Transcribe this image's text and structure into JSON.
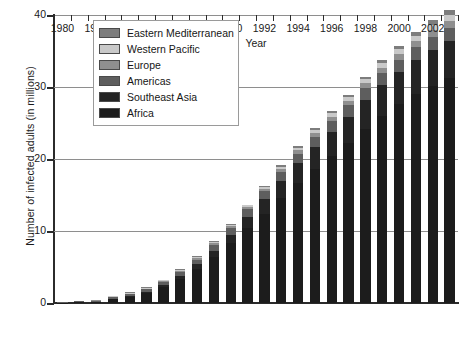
{
  "chart_data": {
    "type": "bar",
    "subtype": "stacked-bar",
    "title": "",
    "xlabel": "Year",
    "ylabel": "Number of infected adults (in millions)",
    "ylim": [
      0,
      40
    ],
    "yticks": [
      0,
      10,
      20,
      30,
      40
    ],
    "ytick_labels": [
      "0",
      "10",
      "20",
      "30",
      "40"
    ],
    "grid": true,
    "grid_axis": "y",
    "legend_position": "upper-left-inside",
    "categories": [
      "1980",
      "1981",
      "1982",
      "1983",
      "1984",
      "1985",
      "1986",
      "1987",
      "1988",
      "1989",
      "1990",
      "1991",
      "1992",
      "1993",
      "1994",
      "1995",
      "1996",
      "1997",
      "1998",
      "1999",
      "2000",
      "2001",
      "2002",
      "2003"
    ],
    "xtick_labels_shown": [
      "1980",
      "1982",
      "1984",
      "1986",
      "1988",
      "1990",
      "1992",
      "1994",
      "1996",
      "1998",
      "2000",
      "2002"
    ],
    "series": [
      {
        "name": "Africa",
        "color": "#1c1c1c",
        "values": [
          0.05,
          0.2,
          0.25,
          0.7,
          1.0,
          1.5,
          2.3,
          3.4,
          4.8,
          6.4,
          8.3,
          10.4,
          12.4,
          14.6,
          16.6,
          18.6,
          20.4,
          22.2,
          24.2,
          26.0,
          27.6,
          29.0,
          30.2,
          31.2
        ]
      },
      {
        "name": "Southeast Asia",
        "color": "#242424",
        "values": [
          0.0,
          0.0,
          0.0,
          0.05,
          0.1,
          0.15,
          0.25,
          0.4,
          0.6,
          0.9,
          1.2,
          1.6,
          2.0,
          2.4,
          2.8,
          3.1,
          3.4,
          3.7,
          4.0,
          4.3,
          4.5,
          4.8,
          5.0,
          5.2
        ]
      },
      {
        "name": "Americas",
        "color": "#5e5e5e",
        "values": [
          0.05,
          0.1,
          0.15,
          0.2,
          0.3,
          0.4,
          0.5,
          0.6,
          0.7,
          0.8,
          0.9,
          1.0,
          1.1,
          1.2,
          1.3,
          1.4,
          1.5,
          1.55,
          1.6,
          1.65,
          1.7,
          1.75,
          1.8,
          1.85
        ]
      },
      {
        "name": "Europe",
        "color": "#8f8f8f",
        "values": [
          0.0,
          0.0,
          0.02,
          0.04,
          0.06,
          0.08,
          0.1,
          0.15,
          0.2,
          0.25,
          0.3,
          0.35,
          0.4,
          0.45,
          0.5,
          0.55,
          0.6,
          0.65,
          0.7,
          0.75,
          0.8,
          0.85,
          0.9,
          0.95
        ]
      },
      {
        "name": "Western Pacific",
        "color": "#c9c9c9",
        "values": [
          0.0,
          0.0,
          0.0,
          0.02,
          0.03,
          0.04,
          0.05,
          0.07,
          0.1,
          0.12,
          0.15,
          0.2,
          0.25,
          0.3,
          0.35,
          0.4,
          0.45,
          0.5,
          0.55,
          0.6,
          0.65,
          0.7,
          0.75,
          0.8
        ]
      },
      {
        "name": "Eastern Mediterranean",
        "color": "#7d7d7d",
        "values": [
          0.0,
          0.0,
          0.0,
          0.01,
          0.02,
          0.03,
          0.04,
          0.05,
          0.06,
          0.08,
          0.1,
          0.12,
          0.15,
          0.18,
          0.2,
          0.25,
          0.3,
          0.35,
          0.4,
          0.45,
          0.5,
          0.55,
          0.6,
          0.65
        ]
      }
    ],
    "totals": [
      0.1,
      0.3,
      0.42,
      1.02,
      1.51,
      2.2,
      3.24,
      4.67,
      6.46,
      8.55,
      10.95,
      13.67,
      16.3,
      19.13,
      21.75,
      24.3,
      26.65,
      28.95,
      31.45,
      33.75,
      35.75,
      37.65,
      39.25,
      40.65
    ]
  },
  "legend": {
    "items": [
      {
        "label": "Eastern Mediterranean",
        "color": "#7d7d7d"
      },
      {
        "label": "Western Pacific",
        "color": "#c9c9c9"
      },
      {
        "label": "Europe",
        "color": "#8f8f8f"
      },
      {
        "label": "Americas",
        "color": "#5e5e5e"
      },
      {
        "label": "Southeast Asia",
        "color": "#242424"
      },
      {
        "label": "Africa",
        "color": "#1c1c1c"
      }
    ]
  },
  "axes": {
    "y_title": "Number of infected adults (in millions)",
    "x_title": "Year"
  }
}
